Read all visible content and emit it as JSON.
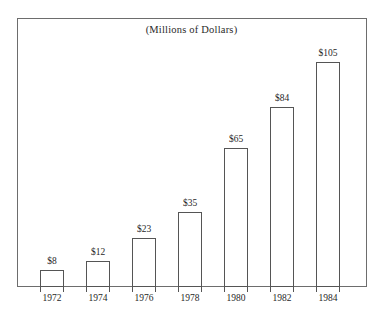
{
  "chart_data": {
    "type": "bar",
    "title": "(Millions of Dollars)",
    "xlabel": "",
    "ylabel": "",
    "categories": [
      "1972",
      "1974",
      "1976",
      "1978",
      "1980",
      "1982",
      "1984"
    ],
    "values": [
      8,
      12,
      23,
      35,
      65,
      84,
      105
    ],
    "value_labels": [
      "$8",
      "$12",
      "$23",
      "$35",
      "$65",
      "$84",
      "$105"
    ],
    "ylim": [
      0,
      122
    ],
    "grid": false,
    "legend": null,
    "axis_visible": true,
    "colors": {
      "bar_fill": "#ffffff",
      "bar_stroke": "#555555",
      "frame_stroke": "#6d6d6d",
      "text": "#1f1f1f",
      "background": "#ffffff"
    }
  }
}
